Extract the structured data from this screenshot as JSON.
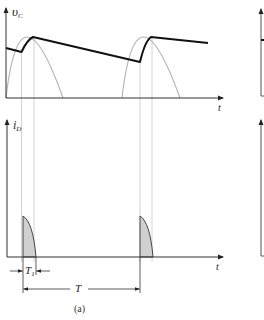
{
  "figure": {
    "caption": "(a)",
    "top_plot": {
      "y_label_main": "υ",
      "y_label_sub": "C",
      "x_label": "t",
      "description": "Capacitor voltage envelope (thick black) riding on rectified sine half-waves (grey)"
    },
    "bottom_plot": {
      "y_label_main": "i",
      "y_label_sub": "D",
      "x_label": "t",
      "description": "Diode current pulses (shaded) during conduction interval"
    },
    "dimensions": {
      "t1_main": "T",
      "t1_sub": "1",
      "period": "T"
    },
    "colors": {
      "axis": "#333333",
      "envelope": "#111111",
      "sine": "#b0b0b0",
      "guide": "#c8c8c8",
      "pulse_fill": "#d0d0d0",
      "pulse_stroke": "#333333"
    }
  }
}
